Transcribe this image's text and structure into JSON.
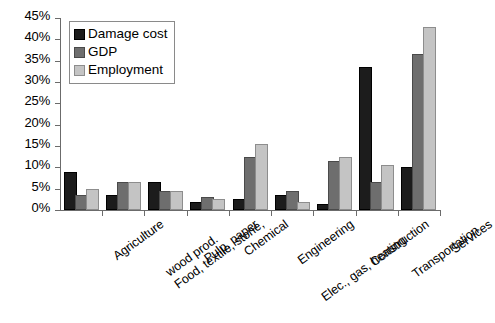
{
  "chart_data": {
    "type": "bar",
    "title": "",
    "xlabel": "",
    "ylabel": "",
    "ylim": [
      0,
      45
    ],
    "ytick_step": 5,
    "ytick_labels": [
      "0%",
      "5%",
      "10%",
      "15%",
      "20%",
      "25%",
      "30%",
      "35%",
      "40%",
      "45%"
    ],
    "ytick_values": [
      0,
      5,
      10,
      15,
      20,
      25,
      30,
      35,
      40,
      45
    ],
    "grid": false,
    "legend_position": "top-left",
    "categories": [
      "Agriculture",
      "Food, textile, stone, wood prod.",
      "Pulp, paper",
      "Chemical",
      "Engineering",
      "Elec., gas, heating",
      "Construction",
      "Transportation",
      "Services"
    ],
    "series": [
      {
        "name": "Damage cost",
        "color": "#1c1c1c",
        "values": [
          8.5,
          3.0,
          6.0,
          1.5,
          2.0,
          3.0,
          1.0,
          33.0,
          9.5
        ]
      },
      {
        "name": "GDP",
        "color": "#6e6e6e",
        "values": [
          3.0,
          6.0,
          4.0,
          2.5,
          12.0,
          4.0,
          11.0,
          6.0,
          36.0
        ]
      },
      {
        "name": "Employment",
        "color": "#c4c4c4",
        "values": [
          4.5,
          6.0,
          4.0,
          2.0,
          15.0,
          1.5,
          12.0,
          10.0,
          42.5
        ]
      }
    ]
  }
}
